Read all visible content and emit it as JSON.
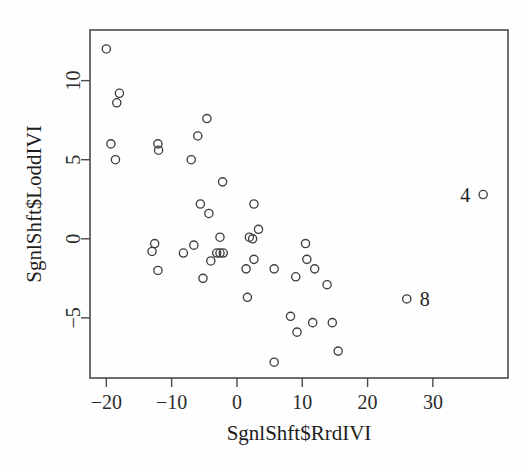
{
  "chart_data": {
    "type": "scatter",
    "title": "",
    "xlabel": "SgnlShft$RrdIVI",
    "ylabel": "SgnlShft$LoddIVI",
    "xlim": [
      -22.5,
      41.5
    ],
    "ylim": [
      -8.8,
      13.2
    ],
    "xticks": [
      -20,
      -10,
      0,
      10,
      20,
      30
    ],
    "yticks": [
      10,
      5,
      0,
      -5
    ],
    "xtick_labels": [
      "−20",
      "−10",
      "0",
      "10",
      "20",
      "30"
    ],
    "ytick_labels": [
      "10",
      "5",
      "0",
      "−5"
    ],
    "grid": false,
    "legend": null,
    "marker": "open-circle",
    "marker_color": "#3f3f3f",
    "points": [
      {
        "x": -20.0,
        "y": 12.0
      },
      {
        "x": -18.0,
        "y": 9.2
      },
      {
        "x": -18.4,
        "y": 8.6
      },
      {
        "x": -19.3,
        "y": 6.0
      },
      {
        "x": -18.6,
        "y": 5.0
      },
      {
        "x": -12.1,
        "y": 6.0
      },
      {
        "x": -12.0,
        "y": 5.6
      },
      {
        "x": -4.6,
        "y": 7.6
      },
      {
        "x": -6.0,
        "y": 6.5
      },
      {
        "x": -7.0,
        "y": 5.0
      },
      {
        "x": -2.2,
        "y": 3.6
      },
      {
        "x": -5.6,
        "y": 2.2
      },
      {
        "x": -4.3,
        "y": 1.6
      },
      {
        "x": 2.6,
        "y": 2.2
      },
      {
        "x": 3.3,
        "y": 0.6
      },
      {
        "x": 1.9,
        "y": 0.1
      },
      {
        "x": 2.4,
        "y": 0.0
      },
      {
        "x": -2.6,
        "y": 0.1
      },
      {
        "x": -12.6,
        "y": -0.3
      },
      {
        "x": -13.0,
        "y": -0.8
      },
      {
        "x": -12.1,
        "y": -2.0
      },
      {
        "x": -8.2,
        "y": -0.9
      },
      {
        "x": -6.6,
        "y": -0.4
      },
      {
        "x": -4.0,
        "y": -1.4
      },
      {
        "x": -5.2,
        "y": -2.5
      },
      {
        "x": -3.1,
        "y": -0.9
      },
      {
        "x": -2.6,
        "y": -0.9
      },
      {
        "x": -2.1,
        "y": -0.9
      },
      {
        "x": 1.4,
        "y": -1.9
      },
      {
        "x": 2.6,
        "y": -1.3
      },
      {
        "x": 1.6,
        "y": -3.7
      },
      {
        "x": 5.7,
        "y": -1.9
      },
      {
        "x": 10.5,
        "y": -0.3
      },
      {
        "x": 10.7,
        "y": -1.3
      },
      {
        "x": 11.9,
        "y": -1.9
      },
      {
        "x": 9.0,
        "y": -2.4
      },
      {
        "x": 13.8,
        "y": -2.9
      },
      {
        "x": 8.2,
        "y": -4.9
      },
      {
        "x": 9.2,
        "y": -5.9
      },
      {
        "x": 11.6,
        "y": -5.3
      },
      {
        "x": 14.6,
        "y": -5.3
      },
      {
        "x": 15.5,
        "y": -7.1
      },
      {
        "x": 5.7,
        "y": -7.8
      },
      {
        "x": 37.7,
        "y": 2.8
      },
      {
        "x": 26.0,
        "y": -3.8
      }
    ],
    "labeled_points": [
      {
        "label": "4",
        "x": 37.7,
        "y": 2.8,
        "side": "left"
      },
      {
        "label": "8",
        "x": 26.0,
        "y": -3.8,
        "side": "right"
      }
    ]
  }
}
